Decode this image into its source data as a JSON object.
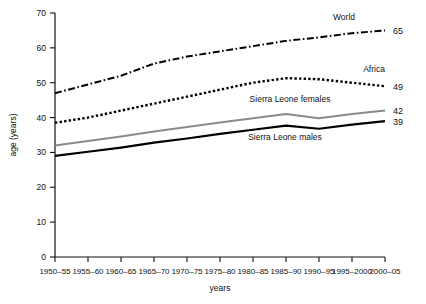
{
  "chart_data": {
    "type": "line",
    "title": "",
    "xlabel": "years",
    "ylabel": "age (years)",
    "ylim": [
      0,
      70
    ],
    "ytick_step": 10,
    "grid": false,
    "legend": "inline-labels",
    "categories": [
      "1950–55",
      "1955–60",
      "1960–65",
      "1965–70",
      "1970–75",
      "1975–80",
      "1980–85",
      "1985–90",
      "1990–95",
      "1995–2000",
      "2000–05"
    ],
    "yticks": [
      0,
      10,
      20,
      30,
      40,
      50,
      60,
      70
    ],
    "series": [
      {
        "name": "World",
        "label": "World",
        "style": "dash-dot",
        "color": "#000000",
        "end_value": "65",
        "values": [
          47.0,
          49.5,
          52.0,
          55.5,
          57.5,
          59.0,
          60.5,
          62.0,
          63.0,
          64.2,
          65.0
        ]
      },
      {
        "name": "Africa",
        "label": "Africa",
        "style": "dotted",
        "color": "#000000",
        "end_value": "49",
        "values": [
          38.5,
          40.0,
          42.0,
          44.0,
          46.0,
          48.0,
          50.0,
          51.3,
          51.0,
          50.0,
          49.0
        ]
      },
      {
        "name": "Sierra Leone females",
        "label": "Sierra Leone females",
        "style": "grey-solid",
        "color": "#8a8a8a",
        "end_value": "42",
        "values": [
          32.0,
          33.3,
          34.6,
          36.0,
          37.3,
          38.6,
          39.8,
          41.0,
          39.8,
          41.0,
          42.0
        ]
      },
      {
        "name": "Sierra Leone males",
        "label": "Sierra Leone males",
        "style": "black-solid",
        "color": "#000000",
        "end_value": "39",
        "values": [
          29.0,
          30.2,
          31.4,
          32.8,
          34.0,
          35.3,
          36.5,
          37.7,
          36.8,
          38.0,
          39.0
        ]
      }
    ],
    "series_label_positions": [
      {
        "series": "World",
        "x": 344,
        "y": 20
      },
      {
        "series": "Africa",
        "x": 374,
        "y": 72
      },
      {
        "series": "Sierra Leone females",
        "x": 290,
        "y": 102
      },
      {
        "series": "Sierra Leone males",
        "x": 285,
        "y": 140
      }
    ]
  }
}
